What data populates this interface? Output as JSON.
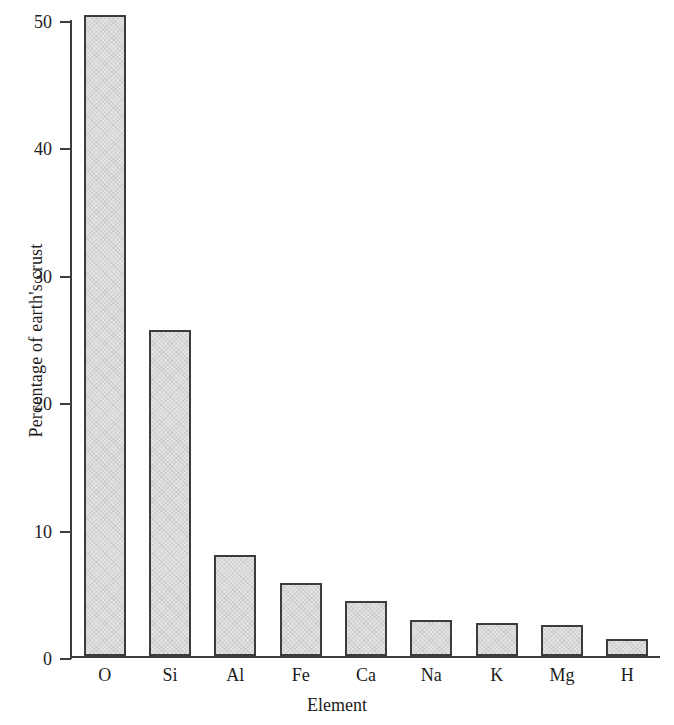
{
  "chart_data": {
    "type": "bar",
    "title": "",
    "subtitle": "",
    "xlabel": "Element",
    "ylabel": "Percentage of earth's crust",
    "categories": [
      "O",
      "Si",
      "Al",
      "Fe",
      "Ca",
      "Na",
      "K",
      "Mg",
      "H"
    ],
    "values": [
      50.3,
      25.6,
      7.9,
      5.7,
      4.3,
      2.8,
      2.6,
      2.4,
      1.3
    ],
    "ylim": [
      0,
      50
    ],
    "yticks": [
      0,
      10,
      20,
      30,
      40,
      50
    ],
    "ytick_labels": [
      "0",
      "10",
      "20",
      "30",
      "40",
      "50"
    ],
    "xlim_categories": 9,
    "grid": false,
    "legend": null,
    "legend_position": "none",
    "annotations": [],
    "style": {
      "bar_fill": "#e3e3e3",
      "bar_edge": "#3c3c3c",
      "axis_color": "#3c3c3c",
      "text_color": "#1c1c1c",
      "background": "#ffffff",
      "tick_direction": "out"
    }
  }
}
